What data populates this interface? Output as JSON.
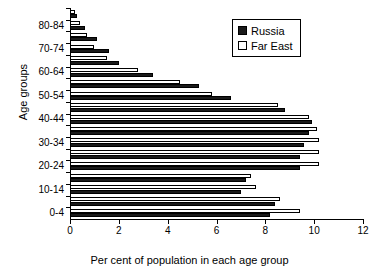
{
  "chart_data": {
    "type": "bar",
    "orientation": "horizontal",
    "title": "",
    "xlabel": "Per cent of population in each age group",
    "ylabel": "Age groups",
    "xlim": [
      0,
      12
    ],
    "xticks": [
      0,
      2,
      4,
      6,
      8,
      10,
      12
    ],
    "xtick_labels": [
      "0",
      "2",
      "4",
      "6",
      "8",
      "10",
      "12"
    ],
    "grid": false,
    "legend_position": "top-right",
    "categories": [
      "0-4",
      "5-9",
      "10-14",
      "15-19",
      "20-24",
      "25-29",
      "30-34",
      "35-39",
      "40-44",
      "45-49",
      "50-54",
      "55-59",
      "60-64",
      "65-69",
      "70-74",
      "75-79",
      "80-84",
      "85+"
    ],
    "ytick_labels": [
      "0-4",
      "10-14",
      "20-24",
      "30-34",
      "40-44",
      "50-54",
      "60-64",
      "70-74",
      "80-84"
    ],
    "series": [
      {
        "name": "Russia",
        "color": "#1a1a1a",
        "values": [
          8.2,
          8.4,
          7.0,
          7.2,
          9.4,
          9.4,
          9.6,
          9.8,
          9.9,
          8.8,
          6.6,
          5.3,
          3.4,
          2.0,
          1.6,
          1.1,
          0.6,
          0.3
        ]
      },
      {
        "name": "Far East",
        "color": "#ffffff",
        "values": [
          9.4,
          8.6,
          7.6,
          7.4,
          10.2,
          10.2,
          10.2,
          10.1,
          9.8,
          8.5,
          5.8,
          4.5,
          2.8,
          1.5,
          1.0,
          0.7,
          0.4,
          0.2
        ]
      }
    ]
  },
  "legend": {
    "items": [
      {
        "label": "Russia",
        "swatch": "filled-square"
      },
      {
        "label": "Far East",
        "swatch": "hollow-square"
      }
    ]
  },
  "axes": {
    "x_title": "Per cent of population in each age group",
    "y_title": "Age groups"
  }
}
